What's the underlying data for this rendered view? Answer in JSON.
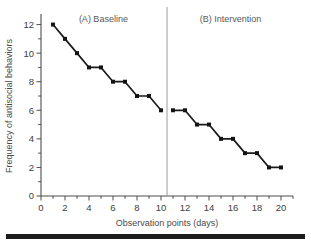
{
  "chart_data": {
    "type": "line",
    "title": "",
    "xlabel": "Observation points (days)",
    "ylabel": "Frequency of antisocial behaviors",
    "xlim": [
      0,
      21
    ],
    "ylim": [
      0,
      12.6
    ],
    "xticks": [
      0,
      2,
      4,
      6,
      8,
      10,
      12,
      14,
      16,
      18,
      20
    ],
    "yticks": [
      0,
      2,
      4,
      6,
      8,
      10,
      12
    ],
    "grid": false,
    "legend_position": "none",
    "phase_divider_x": 10.5,
    "annotations": [
      {
        "text": "(A) Baseline",
        "x": 5.2,
        "y": 12.2
      },
      {
        "text": "(B) Intervention",
        "x": 15.8,
        "y": 12.2
      }
    ],
    "series": [
      {
        "name": "(A) Baseline",
        "x": [
          1,
          2,
          3,
          4,
          5,
          6,
          7,
          8,
          9,
          10
        ],
        "values": [
          12,
          11,
          10,
          9,
          9,
          8,
          8,
          7,
          7,
          6
        ]
      },
      {
        "name": "(B) Intervention",
        "x": [
          11,
          12,
          13,
          14,
          15,
          16,
          17,
          18,
          19,
          20
        ],
        "values": [
          6,
          6,
          5,
          5,
          4,
          4,
          3,
          3,
          2,
          2
        ]
      }
    ]
  },
  "figure": {
    "xlabel": "Observation points (days)",
    "ylabel": "Frequency of antisocial behaviors",
    "phase_a_label": "(A) Baseline",
    "phase_b_label": "(B) Intervention",
    "colors": {
      "line": "#1a1a1a",
      "marker": "#141414",
      "axis": "#4d4d4d",
      "divider": "#9a9aa0",
      "text": "#3d3d3d",
      "rule": "#1c1c1c",
      "background": "#ffffff"
    }
  }
}
